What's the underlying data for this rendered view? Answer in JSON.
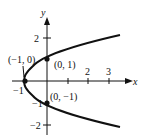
{
  "figure": {
    "equation": "x = y^2 - 1",
    "axes": {
      "x_label": "x",
      "y_label": "y"
    },
    "x_ticks": [
      "-1",
      "2",
      "3"
    ],
    "y_ticks": [
      "2",
      "-1",
      "-2"
    ],
    "points": [
      {
        "label": "(-1, 0)",
        "x": -1,
        "y": 0
      },
      {
        "label": "(0, 1)",
        "x": 0,
        "y": 1
      },
      {
        "label": "(0, -1)",
        "x": 0,
        "y": -1
      }
    ],
    "colors": {
      "stroke": "#111111",
      "background": "#ffffff"
    }
  }
}
